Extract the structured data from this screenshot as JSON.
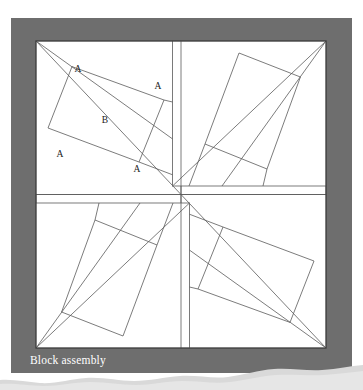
{
  "figure": {
    "kind": "quilt-block-assembly-diagram",
    "caption": "Block assembly",
    "panel_color": "#6e6e6e",
    "block_fill": "#ffffff",
    "seam_color": "#5a5a5a",
    "caption_color": "#ffffff",
    "page_background": "#ffffff",
    "panel": {
      "x": 11,
      "y": 18,
      "width": 341,
      "height": 355
    },
    "block": {
      "x": 36,
      "y": 41,
      "width": 290,
      "height": 307
    },
    "center": {
      "x": 181,
      "y": 194.5
    },
    "labels": [
      {
        "text": "A",
        "x": 78,
        "y": 70
      },
      {
        "text": "A",
        "x": 158,
        "y": 87
      },
      {
        "text": "B",
        "x": 105,
        "y": 121
      },
      {
        "text": "A",
        "x": 60,
        "y": 155
      },
      {
        "text": "A",
        "x": 137,
        "y": 170
      }
    ],
    "quadrants": [
      {
        "name": "top-left",
        "rotation": 0
      },
      {
        "name": "top-right",
        "rotation": 90
      },
      {
        "name": "bottom-right",
        "rotation": 180
      },
      {
        "name": "bottom-left",
        "rotation": 270
      }
    ],
    "unit_pattern": {
      "description": "tilted center square B framed by four A rectangles",
      "pieces": [
        "A",
        "A",
        "A",
        "A",
        "B"
      ]
    },
    "torn_edge": {
      "present": true,
      "color": "#d9d9d9"
    }
  }
}
